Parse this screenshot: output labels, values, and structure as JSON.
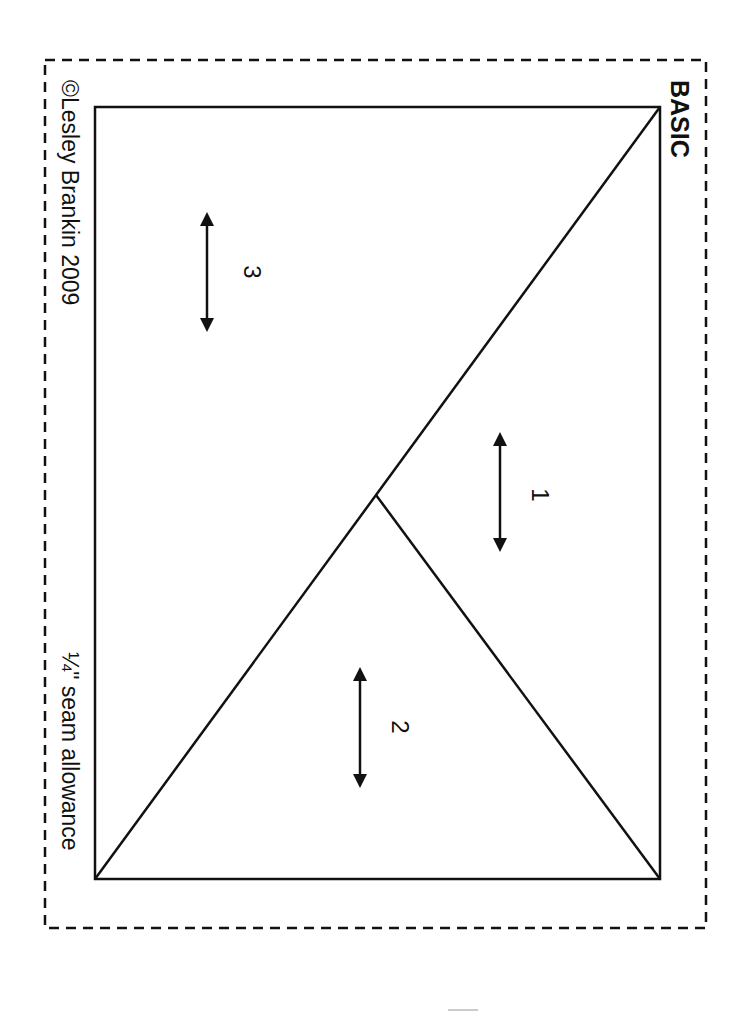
{
  "document": {
    "title": "BASIC",
    "copyright": "©Lesley Brankin 2009",
    "seam_allowance": "¼\" seam allowance",
    "orientation": "rotated 90° clockwise",
    "colors": {
      "ink": "#111111",
      "paper": "#ffffff"
    }
  },
  "pieces": [
    {
      "label": "1",
      "grain_arrow": "vertical-double-arrow"
    },
    {
      "label": "2",
      "grain_arrow": "vertical-double-arrow"
    },
    {
      "label": "3",
      "grain_arrow": "vertical-double-arrow"
    }
  ]
}
